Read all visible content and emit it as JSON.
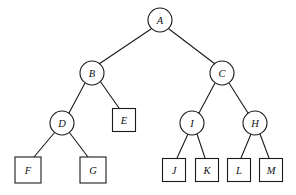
{
  "figure": {
    "name": "binary-tree-diagram",
    "background_color": "#ffffff",
    "stroke_color": "#1a1a1a",
    "label_color": "#111111",
    "width": 296,
    "height": 195
  },
  "nodes": [
    {
      "id": "A",
      "label": "A",
      "shape": "circle",
      "cx": 160,
      "cy": 20,
      "r": 12,
      "level": 0
    },
    {
      "id": "B",
      "label": "B",
      "shape": "circle",
      "cx": 92,
      "cy": 73,
      "r": 12,
      "level": 1
    },
    {
      "id": "C",
      "label": "C",
      "shape": "circle",
      "cx": 222,
      "cy": 73,
      "r": 12,
      "level": 1
    },
    {
      "id": "D",
      "label": "D",
      "shape": "circle",
      "cx": 62,
      "cy": 123,
      "r": 12,
      "level": 2
    },
    {
      "id": "E",
      "label": "E",
      "shape": "square",
      "cx": 124,
      "cy": 120,
      "size": 23,
      "level": 2
    },
    {
      "id": "I",
      "label": "I",
      "shape": "circle",
      "cx": 192,
      "cy": 123,
      "r": 12,
      "level": 2
    },
    {
      "id": "H",
      "label": "H",
      "shape": "circle",
      "cx": 255,
      "cy": 123,
      "r": 12,
      "level": 2
    },
    {
      "id": "F",
      "label": "F",
      "shape": "square",
      "cx": 28,
      "cy": 170,
      "size": 26,
      "level": 3
    },
    {
      "id": "G",
      "label": "G",
      "shape": "square",
      "cx": 93,
      "cy": 170,
      "size": 26,
      "level": 3
    },
    {
      "id": "J",
      "label": "J",
      "shape": "square",
      "cx": 174,
      "cy": 170,
      "size": 23,
      "level": 3
    },
    {
      "id": "K",
      "label": "K",
      "shape": "square",
      "cx": 207,
      "cy": 170,
      "size": 23,
      "level": 3
    },
    {
      "id": "L",
      "label": "L",
      "shape": "square",
      "cx": 239,
      "cy": 170,
      "size": 23,
      "level": 3
    },
    {
      "id": "M",
      "label": "M",
      "shape": "square",
      "cx": 271,
      "cy": 170,
      "size": 23,
      "level": 3
    }
  ],
  "edges": [
    {
      "from": "A",
      "to": "B",
      "x1": 151,
      "y1": 29,
      "x2": 99,
      "y2": 64
    },
    {
      "from": "A",
      "to": "C",
      "x1": 169,
      "y1": 29,
      "x2": 215,
      "y2": 64
    },
    {
      "from": "B",
      "to": "D",
      "x1": 85,
      "y1": 83,
      "x2": 69,
      "y2": 113
    },
    {
      "from": "B",
      "to": "E",
      "x1": 100,
      "y1": 81,
      "x2": 119,
      "y2": 108
    },
    {
      "from": "C",
      "to": "I",
      "x1": 215,
      "y1": 83,
      "x2": 199,
      "y2": 113
    },
    {
      "from": "C",
      "to": "H",
      "x1": 229,
      "y1": 83,
      "x2": 248,
      "y2": 113
    },
    {
      "from": "D",
      "to": "F",
      "x1": 55,
      "y1": 132,
      "x2": 34,
      "y2": 157
    },
    {
      "from": "D",
      "to": "G",
      "x1": 69,
      "y1": 132,
      "x2": 88,
      "y2": 157
    },
    {
      "from": "I",
      "to": "J",
      "x1": 188,
      "y1": 134,
      "x2": 177,
      "y2": 158
    },
    {
      "from": "I",
      "to": "K",
      "x1": 197,
      "y1": 134,
      "x2": 205,
      "y2": 158
    },
    {
      "from": "H",
      "to": "L",
      "x1": 251,
      "y1": 134,
      "x2": 241,
      "y2": 158
    },
    {
      "from": "H",
      "to": "M",
      "x1": 260,
      "y1": 134,
      "x2": 269,
      "y2": 158
    }
  ]
}
